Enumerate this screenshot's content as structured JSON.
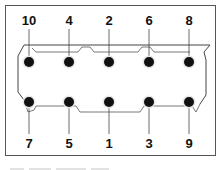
{
  "diagram": {
    "top_row_labels": [
      "10",
      "4",
      "2",
      "6",
      "8"
    ],
    "bottom_row_labels": [
      "7",
      "5",
      "1",
      "3",
      "9"
    ],
    "bolts": [
      {
        "id": "10",
        "row": "top",
        "col": 1
      },
      {
        "id": "4",
        "row": "top",
        "col": 2
      },
      {
        "id": "2",
        "row": "top",
        "col": 3
      },
      {
        "id": "6",
        "row": "top",
        "col": 4
      },
      {
        "id": "8",
        "row": "top",
        "col": 5
      },
      {
        "id": "7",
        "row": "bottom",
        "col": 1
      },
      {
        "id": "5",
        "row": "bottom",
        "col": 2
      },
      {
        "id": "1",
        "row": "bottom",
        "col": 3
      },
      {
        "id": "3",
        "row": "bottom",
        "col": 4
      },
      {
        "id": "9",
        "row": "bottom",
        "col": 5
      }
    ],
    "colors": {
      "bolt": "#111111",
      "outline": "#444444",
      "frame": "#555555"
    }
  }
}
